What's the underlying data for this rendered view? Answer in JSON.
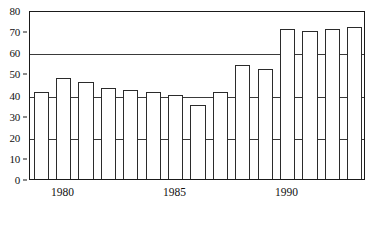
{
  "chart_data": {
    "type": "bar",
    "title": "",
    "subtitle": "",
    "xlabel": "",
    "ylabel": "",
    "ylim": [
      0,
      80
    ],
    "ytick_step": 10,
    "yticks": [
      0,
      10,
      20,
      30,
      40,
      50,
      60,
      70,
      80
    ],
    "ytick_labels": [
      "0",
      "10",
      "20",
      "30",
      "40",
      "50",
      "60",
      "70",
      "80"
    ],
    "gridlines": [
      20,
      40,
      60,
      80
    ],
    "grid": true,
    "legend": null,
    "legend_position": "none",
    "categories": [
      "1979",
      "1980",
      "1981",
      "1982",
      "1983",
      "1984",
      "1985",
      "1986",
      "1987",
      "1988",
      "1989",
      "1990",
      "1991",
      "1992",
      "1993"
    ],
    "xtick_labels": [
      "1980",
      "1985",
      "1990"
    ],
    "xtick_categories": [
      "1980",
      "1985",
      "1990"
    ],
    "values": [
      41,
      48,
      46,
      43,
      42,
      41,
      40,
      35,
      41,
      54,
      52,
      71,
      70,
      71,
      72
    ],
    "bar_facecolor": "#ffffff",
    "bar_edgecolor": "#2b2b2b",
    "axis_color": "#1a1a1a",
    "grid_color": "#3a3a3a",
    "background": "#ffffff"
  }
}
